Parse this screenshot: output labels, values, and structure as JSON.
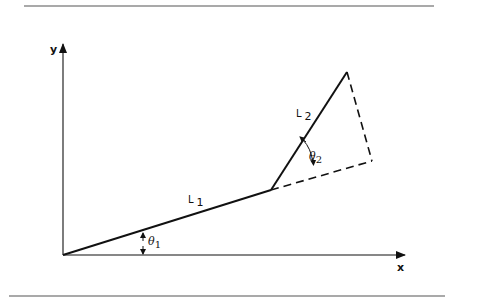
{
  "diagram": {
    "axes": {
      "x_label": "x",
      "y_label": "y"
    },
    "links": [
      {
        "name": "L",
        "sub": "1"
      },
      {
        "name": "L",
        "sub": "2"
      }
    ],
    "angles": [
      {
        "name": "θ",
        "sub": "1"
      },
      {
        "name": "θ",
        "sub": "2"
      }
    ],
    "colors": {
      "ink": "#111111",
      "rule": "#555555",
      "background": "#ffffff"
    }
  }
}
